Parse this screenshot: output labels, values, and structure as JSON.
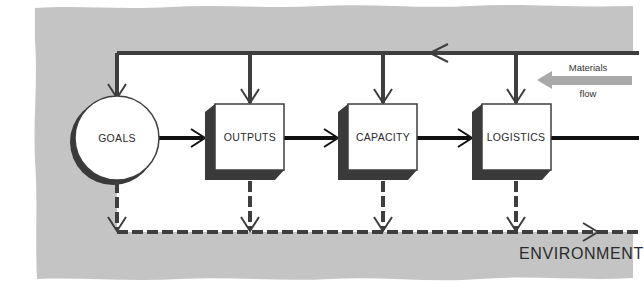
{
  "diagram": {
    "type": "systems-flow",
    "colors": {
      "background_band": "#c4c4c4",
      "interior": "#ffffff",
      "line": "#3e3e3e",
      "shadow": "#3a3a3a",
      "materials_arrow": "#a9a9a9",
      "text": "#2a2a2a"
    },
    "nodes": [
      {
        "id": "goals",
        "label": "GOALS",
        "shape": "circle"
      },
      {
        "id": "outputs",
        "label": "OUTPUTS",
        "shape": "box"
      },
      {
        "id": "capacity",
        "label": "CAPACITY",
        "shape": "box"
      },
      {
        "id": "logistics",
        "label": "LOGISTICS",
        "shape": "box"
      }
    ],
    "edges": [
      {
        "from": "goals",
        "to": "outputs",
        "style": "solid"
      },
      {
        "from": "outputs",
        "to": "capacity",
        "style": "solid"
      },
      {
        "from": "capacity",
        "to": "logistics",
        "style": "solid"
      },
      {
        "from": "logistics",
        "to": "off-right",
        "style": "solid"
      },
      {
        "from": "feedback-line",
        "to": "goals",
        "style": "solid"
      },
      {
        "from": "feedback-line",
        "to": "outputs",
        "style": "solid"
      },
      {
        "from": "feedback-line",
        "to": "capacity",
        "style": "solid"
      },
      {
        "from": "feedback-line",
        "to": "logistics",
        "style": "solid"
      },
      {
        "from": "goals",
        "to": "environment",
        "style": "dashed"
      },
      {
        "from": "outputs",
        "to": "environment",
        "style": "dashed"
      },
      {
        "from": "capacity",
        "to": "environment",
        "style": "dashed"
      },
      {
        "from": "logistics",
        "to": "environment",
        "style": "dashed"
      }
    ],
    "materials_flow": {
      "line1": "Materials",
      "line2": "flow",
      "direction": "left"
    },
    "environment_label": "ENVIRONMENT"
  }
}
